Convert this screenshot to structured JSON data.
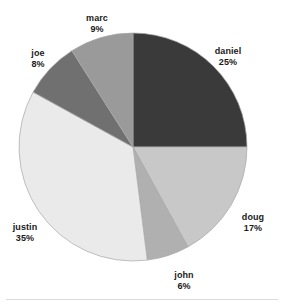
{
  "chart_data": {
    "type": "pie",
    "title": "",
    "subtitle": "",
    "xlabel": "",
    "ylabel": "",
    "legend_position": "none",
    "grid": false,
    "start_angle_deg": 0,
    "direction": "clockwise",
    "units": "percent",
    "categories": [
      "daniel",
      "doug",
      "john",
      "justin",
      "joe",
      "marc"
    ],
    "values": [
      25,
      17,
      6,
      35,
      8,
      9
    ],
    "slices": [
      {
        "label": "daniel",
        "value": 25,
        "value_text": "25%",
        "color": "#3a3a3a",
        "label_x": 228,
        "label_y": 46,
        "label_align": "center"
      },
      {
        "label": "doug",
        "value": 17,
        "value_text": "17%",
        "color": "#c8c8c8",
        "label_x": 253,
        "label_y": 212,
        "label_align": "center"
      },
      {
        "label": "john",
        "value": 6,
        "value_text": "6%",
        "color": "#b0b0b0",
        "label_x": 184,
        "label_y": 270,
        "label_align": "center"
      },
      {
        "label": "justin",
        "value": 35,
        "value_text": "35%",
        "color": "#eaeaea",
        "label_x": 25,
        "label_y": 222,
        "label_align": "center"
      },
      {
        "label": "joe",
        "value": 8,
        "value_text": "8%",
        "color": "#707070",
        "label_x": 38,
        "label_y": 48,
        "label_align": "center"
      },
      {
        "label": "marc",
        "value": 9,
        "value_text": "9%",
        "color": "#9a9a9a",
        "label_x": 97,
        "label_y": 13,
        "label_align": "center"
      }
    ],
    "geometry": {
      "center_x": 133,
      "center_y": 147,
      "radius": 114
    },
    "colors": {
      "daniel": "#3a3a3a",
      "doug": "#c8c8c8",
      "john": "#b0b0b0",
      "justin": "#eaeaea",
      "joe": "#707070",
      "marc": "#9a9a9a",
      "background": "#ffffff",
      "text": "#1a1a1a",
      "slice_outline": "#a8a8a8"
    }
  }
}
